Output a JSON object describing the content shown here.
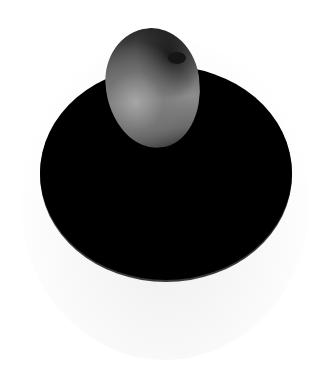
{
  "scene": {
    "description": "Rounded stone or potato resting on top edge of a large black oval disc, white background",
    "colors": {
      "background": "#ffffff",
      "disc": "#000000",
      "stone_highlight": "#8c8c8c",
      "stone_shadow": "#2a2a2a"
    }
  }
}
